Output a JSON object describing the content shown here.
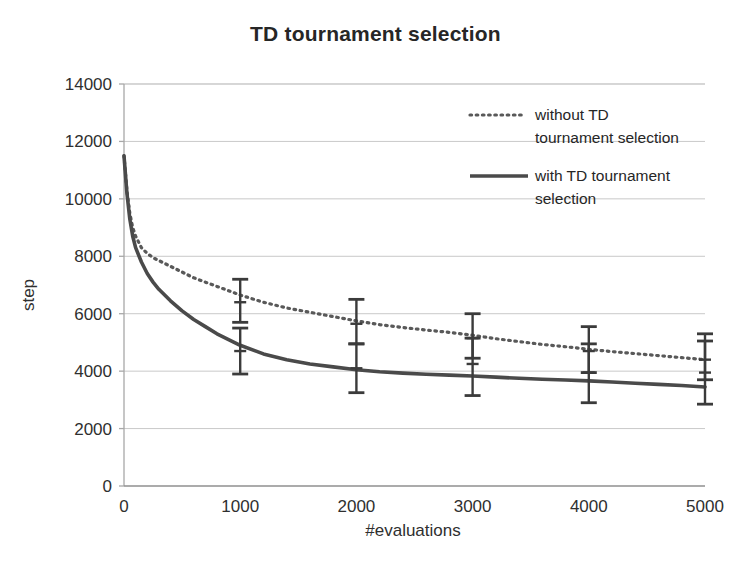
{
  "chart_data": {
    "type": "line",
    "title": "TD tournament selection",
    "xlabel": "#evaluations",
    "ylabel": "step",
    "xlim": [
      0,
      5000
    ],
    "ylim": [
      0,
      14000
    ],
    "xticks": [
      0,
      1000,
      2000,
      3000,
      4000,
      5000
    ],
    "yticks": [
      0,
      2000,
      4000,
      6000,
      8000,
      10000,
      12000,
      14000
    ],
    "xtick_labels": [
      "0",
      "1000",
      "2000",
      "3000",
      "4000",
      "5000"
    ],
    "ytick_labels": [
      "0",
      "2000",
      "4000",
      "6000",
      "8000",
      "10000",
      "12000",
      "14000"
    ],
    "grid": "horizontal",
    "legend_position": "upper-right-inside",
    "series": [
      {
        "name": "without TD tournament selection",
        "style": "dotted",
        "color": "#595959",
        "x": [
          0,
          25,
          50,
          75,
          100,
          150,
          200,
          250,
          300,
          400,
          500,
          600,
          700,
          800,
          900,
          1000,
          1200,
          1400,
          1600,
          1800,
          2000,
          2200,
          2400,
          2600,
          2800,
          3000,
          3200,
          3400,
          3600,
          3800,
          4000,
          4200,
          4400,
          4600,
          4800,
          5000
        ],
        "y": [
          11500,
          10300,
          9500,
          9000,
          8700,
          8300,
          8100,
          7950,
          7850,
          7650,
          7450,
          7250,
          7100,
          6950,
          6800,
          6650,
          6400,
          6200,
          6050,
          5900,
          5750,
          5620,
          5520,
          5430,
          5350,
          5250,
          5130,
          5030,
          4930,
          4850,
          4760,
          4680,
          4610,
          4540,
          4470,
          4400
        ],
        "error_bars": [
          {
            "x": 1000,
            "y": 6400,
            "lower": 5700,
            "upper": 7200
          },
          {
            "x": 2000,
            "y": 5650,
            "lower": 4950,
            "upper": 6500
          },
          {
            "x": 3000,
            "y": 5150,
            "lower": 4450,
            "upper": 6000
          },
          {
            "x": 4000,
            "y": 4700,
            "lower": 3950,
            "upper": 5550
          },
          {
            "x": 5000,
            "y": 4400,
            "lower": 3700,
            "upper": 5300
          }
        ]
      },
      {
        "name": "with TD tournament selection",
        "style": "solid",
        "color": "#4a4a4a",
        "x": [
          0,
          25,
          50,
          75,
          100,
          150,
          200,
          250,
          300,
          400,
          500,
          600,
          700,
          800,
          900,
          1000,
          1200,
          1400,
          1600,
          1800,
          2000,
          2200,
          2400,
          2600,
          2800,
          3000,
          3200,
          3400,
          3600,
          3800,
          4000,
          4200,
          4400,
          4600,
          4800,
          5000
        ],
        "y": [
          11500,
          10200,
          9300,
          8700,
          8300,
          7800,
          7400,
          7100,
          6850,
          6450,
          6100,
          5800,
          5550,
          5300,
          5100,
          4900,
          4600,
          4400,
          4250,
          4150,
          4050,
          3980,
          3930,
          3890,
          3860,
          3830,
          3790,
          3750,
          3720,
          3690,
          3660,
          3620,
          3580,
          3540,
          3500,
          3450
        ],
        "error_bars": [
          {
            "x": 1000,
            "y": 4700,
            "lower": 3900,
            "upper": 5500
          },
          {
            "x": 2000,
            "y": 4100,
            "lower": 3250,
            "upper": 4950
          },
          {
            "x": 3000,
            "y": 4250,
            "lower": 3150,
            "upper": 5150
          },
          {
            "x": 4000,
            "y": 3950,
            "lower": 2900,
            "upper": 4950
          },
          {
            "x": 5000,
            "y": 3950,
            "lower": 2850,
            "upper": 5050
          }
        ]
      }
    ]
  },
  "legend": {
    "entries": [
      {
        "label_line1": "without TD",
        "label_line2": "tournament selection",
        "style": "dotted"
      },
      {
        "label_line1": "with TD tournament",
        "label_line2": "selection",
        "style": "solid"
      }
    ]
  },
  "colors": {
    "grid": "#c9c9c9",
    "axis": "#a8a8a8",
    "series_dotted": "#595959",
    "series_solid": "#4a4a4a",
    "text": "#2b2b2b"
  }
}
